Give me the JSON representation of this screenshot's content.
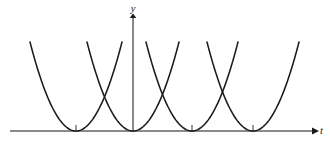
{
  "figure": {
    "background_color": "#ffffff",
    "width": 330,
    "height": 156
  },
  "axes": {
    "x_axis": {
      "label": "t",
      "label_style": "italic",
      "color": "#8a8a8a",
      "y_pixel": 131,
      "x_start": 10,
      "x_end": 312,
      "arrow": "right-arrow-icon"
    },
    "y_axis": {
      "label": "y",
      "label_style": "italic",
      "color": "#8a8a8a",
      "x_pixel": 133,
      "y_start": 132,
      "y_end": 18,
      "arrow": "up-arrow-icon"
    },
    "origin": {
      "x": 133,
      "y": 131
    }
  },
  "ticks": {
    "color": "#9a9a9a",
    "length": 6,
    "x_positions": [
      76,
      192,
      253
    ]
  },
  "chart_data": {
    "type": "line",
    "title": "",
    "xlabel": "t",
    "ylabel": "y",
    "grid": false,
    "legend": null,
    "axis_color": "#8a8a8a",
    "curve_color": "#1a1a1a",
    "curve_width": 1.55,
    "xlim": [
      0,
      330
    ],
    "ylim": [
      131,
      42
    ],
    "vertex_y_pixel": 131,
    "curve_top_y_pixel": 42,
    "curve_half_width_pixel": 46,
    "vertex_spacing_pixel": 58.8,
    "series": [
      {
        "name": "parabola-1",
        "vertex_x": 76,
        "vertex_y": 0,
        "x_left": 30,
        "x_right": 122
      },
      {
        "name": "parabola-2",
        "vertex_x": 133,
        "vertex_y": 0,
        "x_left": 87,
        "x_right": 179
      },
      {
        "name": "parabola-3",
        "vertex_x": 192,
        "vertex_y": 0,
        "x_left": 146,
        "x_right": 238
      },
      {
        "name": "parabola-4",
        "vertex_x": 253,
        "vertex_y": 0,
        "x_left": 207,
        "x_right": 299
      }
    ],
    "intersections_x": [
      104.5,
      162.5,
      222.5
    ]
  }
}
